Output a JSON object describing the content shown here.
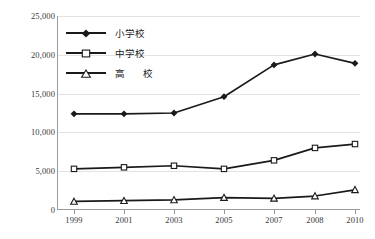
{
  "chart_data": {
    "type": "line",
    "title": "",
    "xlabel": "",
    "ylabel": "",
    "x": [
      "1999",
      "2001",
      "2003",
      "2005",
      "2007",
      "2008",
      "2010"
    ],
    "categories": [
      "1999",
      "2001",
      "2003",
      "2005",
      "2007",
      "2008",
      "2010"
    ],
    "series": [
      {
        "name": "小学校",
        "marker": "filled-diamond",
        "color": "#1a1a1a",
        "values": [
          12400,
          12400,
          12500,
          14600,
          18700,
          20100,
          18900
        ]
      },
      {
        "name": "中学校",
        "marker": "open-square",
        "color": "#1a1a1a",
        "values": [
          5300,
          5500,
          5700,
          5300,
          6400,
          8000,
          8500
        ]
      },
      {
        "name": "高　校",
        "marker": "open-triangle",
        "color": "#1a1a1a",
        "values": [
          1100,
          1200,
          1300,
          1600,
          1500,
          1800,
          2600
        ]
      }
    ],
    "ylim": [
      0,
      25000
    ],
    "yticks": [
      "0",
      "5,000",
      "10,000",
      "15,000",
      "20,000",
      "25,000"
    ],
    "ytick_values": [
      0,
      5000,
      10000,
      15000,
      20000,
      25000
    ],
    "grid": true,
    "legend_position": "upper-left"
  },
  "legend": {
    "items": [
      {
        "label": "小学校",
        "marker": "filled-diamond"
      },
      {
        "label": "中学校",
        "marker": "open-square"
      },
      {
        "label": "高　校",
        "marker": "open-triangle"
      }
    ]
  },
  "axes": {
    "y": {
      "ticks": [
        "0",
        "5,000",
        "10,000",
        "15,000",
        "20,000",
        "25,000"
      ]
    },
    "x": {
      "ticks": [
        "1999",
        "2001",
        "2003",
        "2005",
        "2007",
        "2008",
        "2010"
      ]
    }
  },
  "colors": {
    "line": "#1a1a1a",
    "grid": "#e3e3e3",
    "axis": "#9a9a9a",
    "text": "#3a3a3a",
    "background": "#ffffff"
  }
}
